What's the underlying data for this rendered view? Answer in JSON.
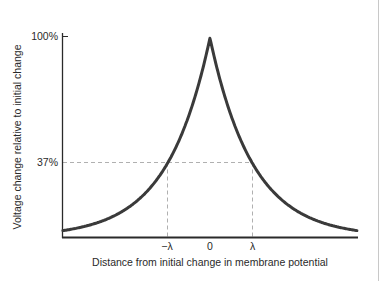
{
  "chart_data": {
    "type": "line",
    "title": "",
    "xlabel": "Distance from initial change in membrane potential",
    "ylabel": "Voltage change relative to initial change",
    "x_tick_labels": [
      "−λ",
      "0",
      "λ"
    ],
    "y_tick_labels": [
      "37%",
      "100%"
    ],
    "x_ticks_in_lambda": [
      -1,
      0,
      1
    ],
    "y_ticks_percent": [
      37,
      100
    ],
    "xlim_lambda": [
      -3.44,
      3.44
    ],
    "ylim_percent": [
      0,
      100
    ],
    "grid": false,
    "legend": null,
    "annotations": [
      {
        "type": "dashed-hline",
        "y_percent": 37,
        "from_x_lambda": -3.44,
        "to_x_lambda": 1
      },
      {
        "type": "dashed-vline",
        "x_lambda": -1,
        "from_y_percent": 0,
        "to_y_percent": 37
      },
      {
        "type": "dashed-vline",
        "x_lambda": 1,
        "from_y_percent": 0,
        "to_y_percent": 37
      }
    ],
    "series": [
      {
        "name": "Voltage decay V(x) = V0 · e^(-|x|/λ)",
        "x_lambda": [
          -3.44,
          -3,
          -2.5,
          -2,
          -1.5,
          -1,
          -0.5,
          0,
          0.5,
          1,
          1.5,
          2,
          2.5,
          3,
          3.44
        ],
        "y_percent": [
          3.2,
          5.0,
          8.2,
          13.5,
          22.3,
          36.8,
          60.7,
          100,
          60.7,
          36.8,
          22.3,
          13.5,
          8.2,
          5.0,
          3.2
        ]
      }
    ]
  },
  "axes": {
    "y_tick_top": "100%",
    "y_tick_mid": "37%",
    "x_tick_neg": "−λ",
    "x_tick_zero": "0",
    "x_tick_pos": "λ",
    "x_label": "Distance from initial change in membrane potential",
    "y_label": "Voltage change relative to initial change"
  },
  "colors": {
    "curve": "#3a3a3a",
    "axis": "#2a2a2a",
    "dashed": "#b0b0b0",
    "border": "#c8c8c8"
  }
}
